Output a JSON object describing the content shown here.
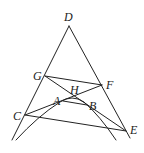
{
  "diagram": {
    "type": "geometry",
    "stroke_color": "#222222",
    "background": "#ffffff",
    "points": [
      {
        "name": "D",
        "x": 69,
        "y": 26,
        "label_x": 64,
        "label_y": 11
      },
      {
        "name": "G",
        "x": 45,
        "y": 76,
        "label_x": 33,
        "label_y": 70
      },
      {
        "name": "F",
        "x": 102,
        "y": 85,
        "label_x": 106,
        "label_y": 79
      },
      {
        "name": "H",
        "x": 74,
        "y": 97,
        "label_x": 70,
        "label_y": 84
      },
      {
        "name": "A",
        "x": 63,
        "y": 101,
        "label_x": 53,
        "label_y": 95
      },
      {
        "name": "B",
        "x": 87,
        "y": 105,
        "label_x": 89,
        "label_y": 100
      },
      {
        "name": "C",
        "x": 25,
        "y": 115,
        "label_x": 13,
        "label_y": 110
      },
      {
        "name": "E",
        "x": 126,
        "y": 131,
        "label_x": 130,
        "label_y": 124
      }
    ],
    "labels": [
      "D",
      "G",
      "F",
      "H",
      "A",
      "B",
      "C",
      "E"
    ],
    "segments": [
      [
        "D",
        "left-end"
      ],
      [
        "D",
        "right-end"
      ],
      [
        "G",
        "F"
      ],
      [
        "G",
        "E"
      ],
      [
        "C",
        "F"
      ],
      [
        "C",
        "E"
      ],
      [
        "A",
        "B"
      ]
    ],
    "curve": "parabola through A and B opening downward"
  }
}
